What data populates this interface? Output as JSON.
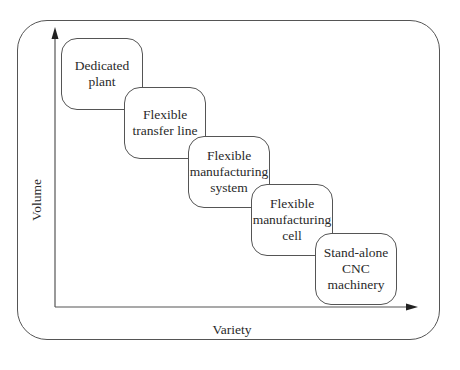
{
  "diagram": {
    "axes": {
      "y_label": "Volume",
      "x_label": "Variety"
    },
    "boxes": [
      {
        "lines": [
          "Dedicated",
          "plant"
        ]
      },
      {
        "lines": [
          "Flexible",
          "transfer line"
        ]
      },
      {
        "lines": [
          "Flexible",
          "manufacturing",
          "system"
        ]
      },
      {
        "lines": [
          "Flexible",
          "manufacturing",
          "cell"
        ]
      },
      {
        "lines": [
          "Stand-alone",
          "CNC",
          "machinery"
        ]
      }
    ],
    "colors": {
      "line": "#555555",
      "text": "#2a2a2a",
      "background": "#ffffff"
    }
  }
}
